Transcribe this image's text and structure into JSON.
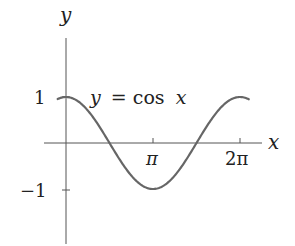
{
  "chart_data": {
    "type": "line",
    "title": "",
    "xlabel": "x",
    "ylabel": "y",
    "series": [
      {
        "name": "y = cos x",
        "function": "cos(x)",
        "domain": [
          -0.3,
          6.6
        ],
        "x": [
          0,
          1.5708,
          3.1416,
          4.7124,
          6.2832
        ],
        "values": [
          1,
          0,
          -1,
          0,
          1
        ]
      }
    ],
    "xticks": [
      {
        "value": 3.1416,
        "label": "π"
      },
      {
        "value": 6.2832,
        "label": "2π"
      }
    ],
    "yticks": [
      {
        "value": 1,
        "label": "1"
      },
      {
        "value": -1,
        "label": "−1"
      }
    ],
    "annotations": [
      {
        "text": "y = cos x",
        "x": 2.4,
        "y": 1.0
      }
    ],
    "grid": false,
    "legend": "none",
    "xlim": [
      -0.3,
      7.0
    ],
    "ylim": [
      -2.3,
      2.3
    ],
    "colors": {
      "curve": "#666666",
      "axes": "#555555",
      "text": "#222222"
    }
  },
  "labels": {
    "x_axis": "x",
    "y_axis": "y",
    "curve_label_lhs": "y",
    "curve_label_eq": "= cos",
    "curve_label_var": "x",
    "tick_pi": "π",
    "tick_2pi": "2π",
    "tick_one": "1",
    "tick_minus_one": "−1"
  }
}
